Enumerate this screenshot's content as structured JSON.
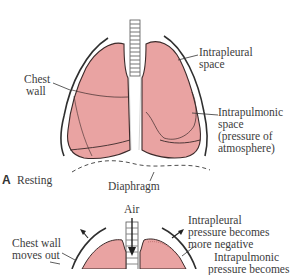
{
  "figure": {
    "colors": {
      "lung_fill": "#E9A3A2",
      "lung_outline": "#3b2a2a",
      "chest_wall": "#2f2f2f",
      "background": "#ffffff"
    },
    "panel_a": {
      "letter": "A",
      "caption": "Resting",
      "labels": {
        "chest_wall_1": "Chest",
        "chest_wall_2": "wall",
        "intrapleural_1": "Intrapleural",
        "intrapleural_2": "space",
        "intrapulmonic_1": "Intrapulmonic",
        "intrapulmonic_2": "space",
        "intrapulmonic_3": "(pressure of",
        "intrapulmonic_4": "atmosphere)",
        "diaphragm": "Diaphragm"
      }
    },
    "panel_b": {
      "labels": {
        "air": "Air",
        "chest_wall_1": "Chest wall",
        "chest_wall_2": "moves out",
        "intrapleural_1": "Intrapleural",
        "intrapleural_2": "pressure becomes",
        "intrapleural_3": "more negative",
        "intrapulmonic_1": "Intrapulmonic",
        "intrapulmonic_2": "pressure becomes"
      }
    }
  }
}
